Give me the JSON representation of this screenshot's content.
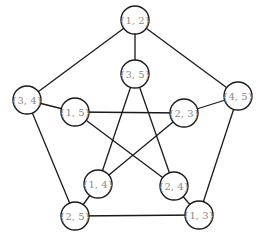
{
  "diagram": {
    "title": "",
    "type": "graph",
    "colors": {
      "line": "#1a1a1a",
      "label": "#8a8a8a",
      "background": "#ffffff"
    },
    "node_radius": 14,
    "nodes": [
      {
        "id": "n12",
        "label": "{1, 2}",
        "x": 135,
        "y": 20
      },
      {
        "id": "n34",
        "label": "{3, 4}",
        "x": 27,
        "y": 100
      },
      {
        "id": "n45",
        "label": "{4, 5}",
        "x": 238,
        "y": 96
      },
      {
        "id": "n25",
        "label": "{2, 5}",
        "x": 75,
        "y": 216
      },
      {
        "id": "n13",
        "label": "{1, 3}",
        "x": 199,
        "y": 215
      },
      {
        "id": "n35",
        "label": "{3, 5}",
        "x": 135,
        "y": 74
      },
      {
        "id": "n15",
        "label": "{1, 5}",
        "x": 75,
        "y": 112
      },
      {
        "id": "n23",
        "label": "{2, 3}",
        "x": 184,
        "y": 113
      },
      {
        "id": "n14",
        "label": "{1, 4}",
        "x": 98,
        "y": 184
      },
      {
        "id": "n24",
        "label": "{2, 4}",
        "x": 174,
        "y": 186
      }
    ],
    "edges": [
      [
        "n12",
        "n34"
      ],
      [
        "n12",
        "n45"
      ],
      [
        "n34",
        "n25"
      ],
      [
        "n45",
        "n13"
      ],
      [
        "n25",
        "n13"
      ],
      [
        "n12",
        "n35"
      ],
      [
        "n34",
        "n15"
      ],
      [
        "n45",
        "n23"
      ],
      [
        "n25",
        "n14"
      ],
      [
        "n13",
        "n24"
      ],
      [
        "n15",
        "n23"
      ],
      [
        "n15",
        "n24"
      ],
      [
        "n35",
        "n14"
      ],
      [
        "n35",
        "n24"
      ],
      [
        "n23",
        "n14"
      ]
    ]
  }
}
